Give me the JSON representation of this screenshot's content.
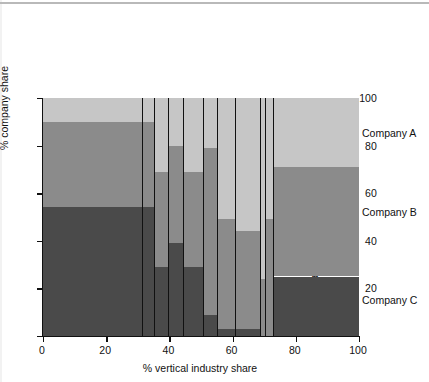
{
  "chart_data": {
    "type": "bar",
    "variant": "marimekko-mosaic-stacked-100",
    "title": "",
    "xlabel": "% vertical industry share",
    "ylabel": "% company share",
    "xlim": [
      0,
      100
    ],
    "ylim": [
      0,
      100
    ],
    "xticks": [
      0,
      20,
      40,
      60,
      80,
      100
    ],
    "yticks": [
      0,
      20,
      40,
      60,
      80,
      100
    ],
    "xtick_labels": [
      "0",
      "20",
      "40",
      "60",
      "80",
      "100"
    ],
    "ytick_labels": [
      "0",
      "20",
      "40",
      "60",
      "80",
      "100"
    ],
    "grid": false,
    "legend_position": "right",
    "series": [
      {
        "name": "Company A",
        "color": "#c6c6c6"
      },
      {
        "name": "Company B",
        "color": "#8b8b8b"
      },
      {
        "name": "Company C",
        "color": "#4a4a4a"
      }
    ],
    "categories": [
      "Machine shops",
      "Printers",
      "Furniture",
      "Apparel",
      "Plastics",
      "Sawmills",
      "Bakeries",
      "Construction",
      "Jewellery",
      "Sheet metal",
      "Rest of world"
    ],
    "columns": [
      {
        "label": "Machine shops",
        "x_start": 0,
        "x_end": 31.5,
        "width": 31.5,
        "A": 10,
        "B": 36,
        "C": 54
      },
      {
        "label": "Printers",
        "x_start": 31.5,
        "x_end": 35.5,
        "width": 4.0,
        "A": 10,
        "B": 36,
        "C": 54
      },
      {
        "label": "Furniture",
        "x_start": 35.5,
        "x_end": 40.0,
        "width": 4.5,
        "A": 31,
        "B": 40,
        "C": 29
      },
      {
        "label": "Apparel",
        "x_start": 40.0,
        "x_end": 44.5,
        "width": 4.5,
        "A": 20,
        "B": 41,
        "C": 39
      },
      {
        "label": "Plastics",
        "x_start": 44.5,
        "x_end": 51.0,
        "width": 6.5,
        "A": 31,
        "B": 40,
        "C": 29
      },
      {
        "label": "Sawmills",
        "x_start": 51.0,
        "x_end": 55.5,
        "width": 4.5,
        "A": 21,
        "B": 70,
        "C": 9
      },
      {
        "label": "Bakeries",
        "x_start": 55.5,
        "x_end": 61.0,
        "width": 5.5,
        "A": 51,
        "B": 46,
        "C": 3
      },
      {
        "label": "Construction",
        "x_start": 61.0,
        "x_end": 69.0,
        "width": 8.0,
        "A": 56,
        "B": 41,
        "C": 3
      },
      {
        "label": "Jewellery",
        "x_start": 69.0,
        "x_end": 70.5,
        "width": 1.5,
        "A": 76,
        "B": 24,
        "C": 0
      },
      {
        "label": "Sheet metal",
        "x_start": 70.5,
        "x_end": 73.0,
        "width": 2.5,
        "A": 51,
        "B": 49,
        "C": 0
      },
      {
        "label": "Rest of world",
        "x_start": 73.0,
        "x_end": 100.0,
        "width": 27.0,
        "A": 29,
        "B": 46,
        "C": 25
      }
    ]
  },
  "legend": {
    "items": [
      {
        "label": "Company A",
        "y": 133
      },
      {
        "label": "Company B",
        "y": 212
      },
      {
        "label": "Company C",
        "y": 300
      }
    ]
  }
}
